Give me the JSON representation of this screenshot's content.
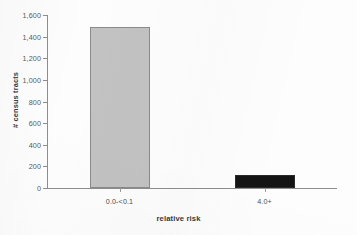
{
  "chart_data": {
    "type": "bar",
    "title": "",
    "xlabel": "relative risk",
    "ylabel": "# census tracts",
    "categories": [
      "0.0-<0.1",
      "4.0+"
    ],
    "values": [
      1490,
      120
    ],
    "series": [
      {
        "name": "# census tracts",
        "values": [
          1490,
          120
        ],
        "colors": [
          "#c2c2c2",
          "#141414"
        ]
      }
    ],
    "ylim": [
      0,
      1600
    ],
    "ytick_labels": [
      "0",
      "200",
      "400",
      "600",
      "800",
      "1,000",
      "1,200",
      "1,400",
      "1,600"
    ],
    "ytick_values": [
      0,
      200,
      400,
      600,
      800,
      1000,
      1200,
      1400,
      1600
    ],
    "grid": false,
    "legend": false,
    "bar_colors": {
      "low_risk": "#c2c2c2",
      "high_risk": "#141414"
    },
    "axis_color": "#8d8d8d"
  }
}
